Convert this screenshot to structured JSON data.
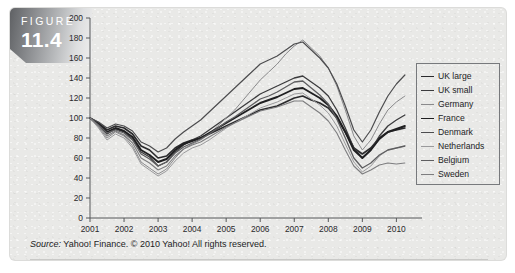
{
  "figure": {
    "badge_word": "FIGURE",
    "badge_number": "11.4"
  },
  "source": {
    "keyword": "Source:",
    "text": " Yahoo! Finance. © 2010 Yahoo! All rights reserved."
  },
  "legend": {
    "position": "right",
    "entries": [
      {
        "label": "UK large",
        "color": "#2b2b2d",
        "width": 1.7
      },
      {
        "label": "UK small",
        "color": "#3b3b3d",
        "width": 1.3
      },
      {
        "label": "Germany",
        "color": "#8a8a8c",
        "width": 1.0
      },
      {
        "label": "France",
        "color": "#1f1f21",
        "width": 1.9
      },
      {
        "label": "Denmark",
        "color": "#4c4c4e",
        "width": 1.2
      },
      {
        "label": "Netherlands",
        "color": "#9a9a9c",
        "width": 1.0
      },
      {
        "label": "Belgium",
        "color": "#5e5e60",
        "width": 1.3
      },
      {
        "label": "Sweden",
        "color": "#7d7d7f",
        "width": 1.1
      }
    ]
  },
  "chart_data": {
    "type": "line",
    "title": "",
    "xlabel": "",
    "ylabel": "",
    "xlim": [
      2001,
      2010.4
    ],
    "ylim": [
      0,
      200
    ],
    "ytick_values": [
      0,
      20,
      40,
      60,
      80,
      100,
      120,
      140,
      160,
      180,
      200
    ],
    "ytick_labels": [
      "0",
      "20",
      "40",
      "60",
      "80",
      "100",
      "120",
      "140",
      "160",
      "180",
      "200"
    ],
    "xtick_values": [
      2001,
      2002,
      2003,
      2004,
      2005,
      2006,
      2007,
      2008,
      2009,
      2010
    ],
    "xtick_labels": [
      "2001",
      "2002",
      "2003",
      "2004",
      "2005",
      "2006",
      "2007",
      "2008",
      "2009",
      "2010"
    ],
    "grid": false,
    "legend_position": "right",
    "x": [
      2001.0,
      2001.25,
      2001.5,
      2001.75,
      2002.0,
      2002.25,
      2002.5,
      2002.75,
      2003.0,
      2003.25,
      2003.5,
      2003.75,
      2004.0,
      2004.25,
      2004.5,
      2004.75,
      2005.0,
      2005.25,
      2005.5,
      2005.75,
      2006.0,
      2006.25,
      2006.5,
      2006.75,
      2007.0,
      2007.25,
      2007.5,
      2007.75,
      2008.0,
      2008.25,
      2008.5,
      2008.75,
      2009.0,
      2009.25,
      2009.5,
      2009.75,
      2010.0,
      2010.25
    ],
    "series": [
      {
        "name": "UK large",
        "color": "#2b2b2d",
        "width": 1.7,
        "values": [
          100,
          95,
          88,
          92,
          90,
          84,
          72,
          68,
          60,
          62,
          70,
          75,
          78,
          80,
          84,
          88,
          92,
          96,
          100,
          104,
          108,
          110,
          112,
          116,
          120,
          122,
          118,
          115,
          110,
          100,
          86,
          70,
          64,
          70,
          80,
          86,
          88,
          90
        ]
      },
      {
        "name": "UK small",
        "color": "#3b3b3d",
        "width": 1.3,
        "values": [
          100,
          93,
          84,
          89,
          86,
          79,
          66,
          61,
          52,
          56,
          66,
          73,
          78,
          82,
          88,
          94,
          100,
          106,
          112,
          118,
          124,
          128,
          132,
          136,
          140,
          142,
          136,
          130,
          122,
          108,
          90,
          70,
          60,
          68,
          82,
          92,
          98,
          103
        ]
      },
      {
        "name": "Germany",
        "color": "#8a8a8c",
        "width": 1.0,
        "values": [
          100,
          91,
          80,
          86,
          82,
          72,
          56,
          50,
          44,
          49,
          60,
          69,
          74,
          78,
          84,
          92,
          100,
          108,
          118,
          128,
          138,
          146,
          154,
          164,
          172,
          178,
          170,
          162,
          150,
          132,
          108,
          82,
          68,
          78,
          94,
          108,
          116,
          122
        ]
      },
      {
        "name": "France",
        "color": "#1f1f21",
        "width": 1.9,
        "values": [
          100,
          94,
          86,
          90,
          87,
          81,
          68,
          63,
          56,
          59,
          68,
          74,
          77,
          80,
          85,
          90,
          95,
          100,
          105,
          110,
          115,
          118,
          121,
          125,
          129,
          130,
          125,
          120,
          113,
          102,
          86,
          68,
          60,
          68,
          79,
          86,
          89,
          92
        ]
      },
      {
        "name": "Denmark",
        "color": "#4c4c4e",
        "width": 1.2,
        "values": [
          100,
          96,
          90,
          94,
          92,
          87,
          76,
          72,
          66,
          70,
          79,
          86,
          92,
          98,
          106,
          114,
          122,
          130,
          138,
          146,
          154,
          158,
          162,
          168,
          174,
          176,
          168,
          160,
          150,
          134,
          112,
          88,
          76,
          88,
          106,
          122,
          134,
          143
        ]
      },
      {
        "name": "Netherlands",
        "color": "#9a9a9c",
        "width": 1.0,
        "values": [
          100,
          90,
          78,
          84,
          80,
          70,
          54,
          48,
          42,
          47,
          57,
          65,
          70,
          73,
          78,
          84,
          90,
          95,
          100,
          105,
          110,
          113,
          116,
          120,
          124,
          125,
          119,
          113,
          105,
          92,
          74,
          56,
          46,
          52,
          62,
          68,
          70,
          72
        ]
      },
      {
        "name": "Belgium",
        "color": "#5e5e60",
        "width": 1.3,
        "values": [
          100,
          93,
          85,
          88,
          85,
          78,
          64,
          59,
          52,
          56,
          65,
          71,
          75,
          79,
          84,
          90,
          96,
          101,
          107,
          113,
          119,
          122,
          126,
          131,
          136,
          137,
          130,
          123,
          114,
          99,
          80,
          60,
          50,
          55,
          63,
          68,
          70,
          72
        ]
      },
      {
        "name": "Sweden",
        "color": "#7d7d7f",
        "width": 1.1,
        "values": [
          100,
          92,
          82,
          87,
          83,
          75,
          60,
          55,
          48,
          52,
          62,
          69,
          73,
          76,
          81,
          86,
          91,
          95,
          99,
          103,
          107,
          109,
          111,
          114,
          117,
          117,
          111,
          105,
          97,
          85,
          68,
          52,
          44,
          48,
          53,
          55,
          54,
          55
        ]
      }
    ]
  }
}
